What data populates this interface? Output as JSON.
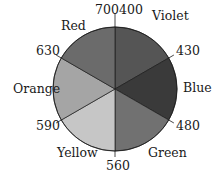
{
  "chart_data": {
    "type": "pie",
    "title": "",
    "center": [
      115,
      89
    ],
    "radius": 62,
    "segments": [
      {
        "name": "Violet",
        "range": [
          400,
          430
        ],
        "start_deg": 0,
        "end_deg": 60,
        "fill": "#555555"
      },
      {
        "name": "Blue",
        "range": [
          430,
          480
        ],
        "start_deg": 60,
        "end_deg": 120,
        "fill": "#3a3a3a"
      },
      {
        "name": "Green",
        "range": [
          480,
          560
        ],
        "start_deg": 120,
        "end_deg": 180,
        "fill": "#717171"
      },
      {
        "name": "Yellow",
        "range": [
          560,
          590
        ],
        "start_deg": 180,
        "end_deg": 240,
        "fill": "#c6c6c6"
      },
      {
        "name": "Orange",
        "range": [
          590,
          630
        ],
        "start_deg": 240,
        "end_deg": 300,
        "fill": "#a5a5a5"
      },
      {
        "name": "Red",
        "range": [
          630,
          700
        ],
        "start_deg": 300,
        "end_deg": 360,
        "fill": "#6b6b6b"
      }
    ],
    "boundary_labels": [
      "700",
      "400",
      "430",
      "480",
      "560",
      "590",
      "630"
    ]
  },
  "labels": {
    "violet": "Violet",
    "blue": "Blue",
    "green": "Green",
    "yellow": "Yellow",
    "orange": "Orange",
    "red": "Red",
    "b700": "700",
    "b400": "400",
    "b430": "430",
    "b480": "480",
    "b560": "560",
    "b590": "590",
    "b630": "630"
  }
}
